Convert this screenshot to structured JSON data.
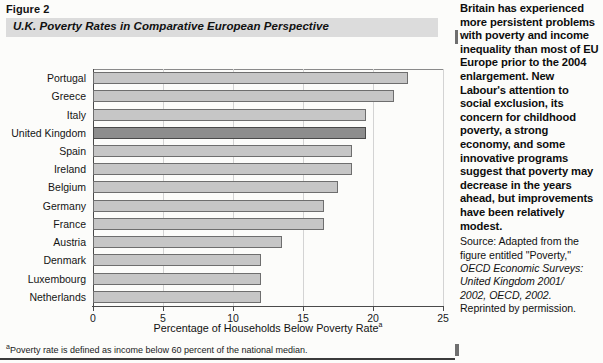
{
  "figure": {
    "number_label": "Figure 2",
    "title": "U.K. Poverty Rates in Comparative European Perspective",
    "footnote_marker": "a",
    "footnote_text": "Poverty rate is defined as income below 60 percent of the national median."
  },
  "chart_data": {
    "type": "bar",
    "orientation": "horizontal",
    "title": "U.K. Poverty Rates in Comparative European Perspective",
    "xlabel": "Percentage of Households Below Poverty Rate",
    "xlabel_superscript": "a",
    "ylabel": "",
    "xlim": [
      0,
      25
    ],
    "xticks": [
      0,
      5,
      10,
      15,
      20,
      25
    ],
    "xticklabels": [
      "0",
      "5",
      "10",
      "15",
      "20",
      "25"
    ],
    "grid": "vertical",
    "legend": "none",
    "highlight_category": "United Kingdom",
    "highlight_color": "#8d8d8d",
    "bar_color": "#c6c6c6",
    "categories": [
      "Portugal",
      "Greece",
      "Italy",
      "United Kingdom",
      "Spain",
      "Ireland",
      "Belgium",
      "Germany",
      "France",
      "Austria",
      "Denmark",
      "Luxembourg",
      "Netherlands"
    ],
    "values": [
      22.5,
      21.5,
      19.5,
      19.5,
      18.5,
      18.5,
      17.5,
      16.5,
      16.5,
      13.5,
      12,
      12,
      12
    ]
  },
  "commentary": {
    "paragraph": "Britain has experienced more persistent problems with poverty and income inequality than most of EU Europe prior to the 2004 enlargement. New Labour's attention to social exclusion, its concern for childhood poverty, a strong economy, and some innovative programs suggest that poverty may decrease in the years ahead, but improvements have been relatively modest.",
    "source_lines": [
      "Source: Adapted from the",
      "figure entitled \"Poverty,\"",
      "OECD Economic Surveys:",
      "United Kingdom 2001/",
      "2002, OECD, 2002.",
      "Reprinted by permission."
    ]
  }
}
